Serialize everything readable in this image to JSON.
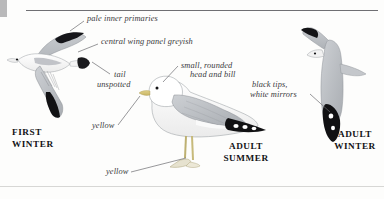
{
  "plate": {
    "species_subject": "gull-identification-plate",
    "background_color": "#fdfdfc",
    "ink_color": "#3a3a3c",
    "mantle_grey": "#b9bcc0",
    "wingtip_black": "#121214",
    "leg_bill_yellow": "#d9c87a"
  },
  "annotations": [
    {
      "id": "pale-inner-primaries",
      "text": "pale inner primaries"
    },
    {
      "id": "central-wing-panel",
      "text": "central wing panel greyish"
    },
    {
      "id": "tail-unspotted-line1",
      "text": "tail"
    },
    {
      "id": "tail-unspotted-line2",
      "text": "unspotted"
    },
    {
      "id": "head-and-bill-line1",
      "text": "small, rounded"
    },
    {
      "id": "head-and-bill-line2",
      "text": "head and bill"
    },
    {
      "id": "black-tips-line1",
      "text": "black tips,"
    },
    {
      "id": "black-tips-line2",
      "text": "white mirrors"
    },
    {
      "id": "yellow-bill",
      "text": "yellow"
    },
    {
      "id": "yellow-legs",
      "text": "yellow"
    }
  ],
  "age_labels": [
    {
      "id": "first-winter",
      "text": "FIRST\nWINTER"
    },
    {
      "id": "adult-summer",
      "text": "ADULT\nSUMMER"
    },
    {
      "id": "adult-winter",
      "text": "ADULT\nWINTER"
    }
  ],
  "figures": [
    {
      "id": "flying-gull-first-winter",
      "pose": "flying-side-view",
      "age": "FIRST WINTER"
    },
    {
      "id": "standing-gull-adult-summer",
      "pose": "standing-side-view",
      "age": "ADULT SUMMER"
    },
    {
      "id": "flying-gull-adult-winter",
      "pose": "flying-vertical-view",
      "age": "ADULT WINTER"
    }
  ]
}
